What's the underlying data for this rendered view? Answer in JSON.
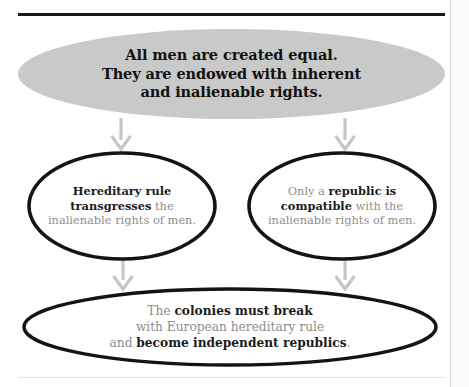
{
  "diagram": {
    "type": "argument-flow-chart",
    "accent_fill": "#c9c9c9",
    "stroke_color": "#141414",
    "muted_text_color": "#8e8e8e",
    "emphasis_text_color": "#1b1b1b",
    "arrow_color": "#c6c6c6",
    "rule_color": "#1a1a1a"
  },
  "nodes": {
    "premise": {
      "name": "premise",
      "line1": "All men are created equal.",
      "line2": "They are endowed with inherent",
      "line3": "and inalienable rights."
    },
    "hereditary": {
      "name": "hereditary-rule",
      "seg1_bold": "Hereditary rule",
      "seg2_bold": "transgresses",
      "seg3_plain": " the",
      "seg4_plain": "inalienable rights of men."
    },
    "republic": {
      "name": "republic-compatible",
      "seg1_plain": "Only a ",
      "seg2_bold": "republic is",
      "seg3_bold": "compatible",
      "seg4_plain": " with the",
      "seg5_plain": "inalienable rights of men."
    },
    "conclusion": {
      "name": "colonies-conclusion",
      "seg1_plain": "The ",
      "seg2_bold": "colonies must break",
      "seg3_plain": "with European hereditary rule",
      "seg4_plain": "and ",
      "seg5_bold": "become independent republics",
      "seg6_plain": "."
    }
  },
  "arrows": [
    {
      "name": "arrow-premise-to-hereditary",
      "from": "premise",
      "to": "hereditary"
    },
    {
      "name": "arrow-premise-to-republic",
      "from": "premise",
      "to": "republic"
    },
    {
      "name": "arrow-hereditary-to-conclusion",
      "from": "hereditary",
      "to": "conclusion"
    },
    {
      "name": "arrow-republic-to-conclusion",
      "from": "republic",
      "to": "conclusion"
    }
  ]
}
